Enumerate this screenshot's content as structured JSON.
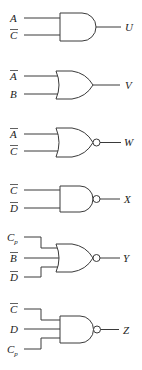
{
  "diagram": {
    "type": "logic-gates",
    "gates": [
      {
        "id": "U",
        "kind": "AND",
        "inputs": [
          {
            "name": "A",
            "negated": false
          },
          {
            "name": "C",
            "negated": true
          }
        ],
        "output": "U"
      },
      {
        "id": "V",
        "kind": "OR",
        "inputs": [
          {
            "name": "A",
            "negated": true
          },
          {
            "name": "B",
            "negated": false
          }
        ],
        "output": "V"
      },
      {
        "id": "W",
        "kind": "NOR",
        "inputs": [
          {
            "name": "A",
            "negated": true
          },
          {
            "name": "C",
            "negated": true
          }
        ],
        "output": "W"
      },
      {
        "id": "X",
        "kind": "NAND",
        "inputs": [
          {
            "name": "C",
            "negated": true
          },
          {
            "name": "D",
            "negated": true
          }
        ],
        "output": "X"
      },
      {
        "id": "Y",
        "kind": "NOR",
        "inputs": [
          {
            "name": "C",
            "sub": "p",
            "negated": false
          },
          {
            "name": "B",
            "negated": true
          },
          {
            "name": "D",
            "negated": true
          }
        ],
        "output": "Y"
      },
      {
        "id": "Z",
        "kind": "NAND",
        "inputs": [
          {
            "name": "C",
            "negated": true
          },
          {
            "name": "D",
            "negated": false
          },
          {
            "name": "C",
            "sub": "p",
            "negated": false
          }
        ],
        "output": "Z"
      }
    ]
  },
  "labels": {
    "u_in1": "A",
    "u_in2": "C",
    "u_out": "U",
    "v_in1": "A",
    "v_in2": "B",
    "v_out": "V",
    "w_in1": "A",
    "w_in2": "C",
    "w_out": "W",
    "x_in1": "C",
    "x_in2": "D",
    "x_out": "X",
    "y_in1": "C",
    "y_in1_sub": "p",
    "y_in2": "B",
    "y_in3": "D",
    "y_out": "Y",
    "z_in1": "C",
    "z_in2": "D",
    "z_in3": "C",
    "z_in3_sub": "p",
    "z_out": "Z"
  }
}
